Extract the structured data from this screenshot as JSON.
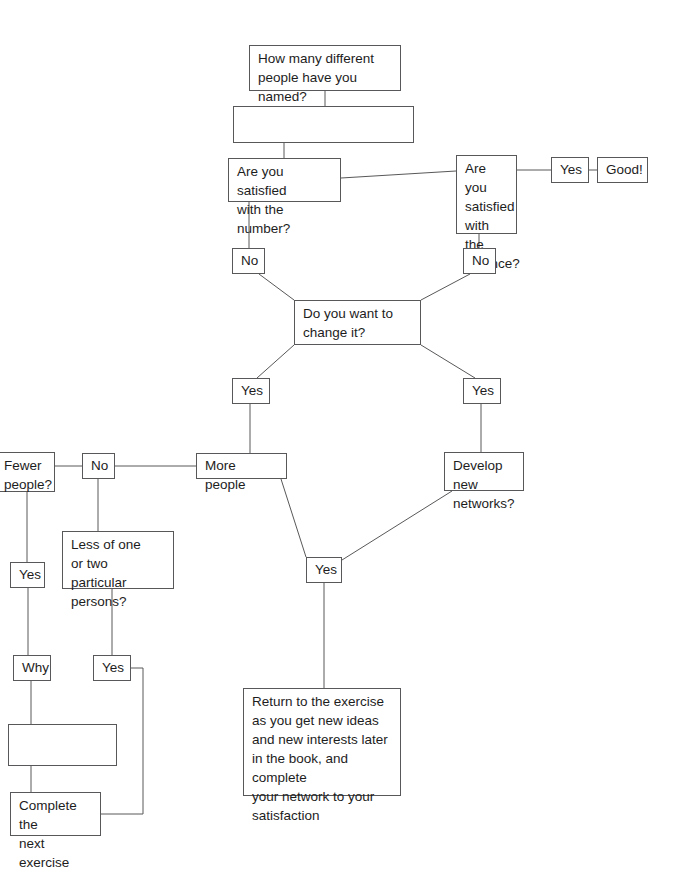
{
  "diagram": {
    "stroke_color": "#58585a",
    "text_color": "#1d1d1d",
    "background": "#ffffff",
    "nodes": [
      {
        "id": "how-many",
        "label": "How many different\npeople have you named?",
        "x": 249,
        "y": 45,
        "w": 152,
        "h": 46
      },
      {
        "id": "answer-blank-1",
        "label": "",
        "x": 233,
        "y": 106,
        "w": 181,
        "h": 37
      },
      {
        "id": "satisfied-number",
        "label": "Are you satisfied\nwith the number?",
        "x": 228,
        "y": 158,
        "w": 113,
        "h": 44
      },
      {
        "id": "satisfied-balance",
        "label": "Are you\nsatisfied\nwith the\nbalance?",
        "x": 456,
        "y": 155,
        "w": 61,
        "h": 79
      },
      {
        "id": "yes-balance",
        "label": "Yes",
        "x": 551,
        "y": 157,
        "w": 38,
        "h": 26
      },
      {
        "id": "good",
        "label": "Good!",
        "x": 597,
        "y": 157,
        "w": 51,
        "h": 26
      },
      {
        "id": "no-number",
        "label": "No",
        "x": 232,
        "y": 248,
        "w": 33,
        "h": 26
      },
      {
        "id": "no-balance",
        "label": "No",
        "x": 463,
        "y": 248,
        "w": 33,
        "h": 26
      },
      {
        "id": "change-it",
        "label": "Do you want to\nchange it?",
        "x": 294,
        "y": 300,
        "w": 127,
        "h": 45
      },
      {
        "id": "yes-left",
        "label": "Yes",
        "x": 232,
        "y": 378,
        "w": 38,
        "h": 26
      },
      {
        "id": "yes-right",
        "label": "Yes",
        "x": 463,
        "y": 378,
        "w": 38,
        "h": 26
      },
      {
        "id": "more-people",
        "label": "More people",
        "x": 196,
        "y": 453,
        "w": 91,
        "h": 26
      },
      {
        "id": "develop-networks",
        "label": "Develop new\nnetworks?",
        "x": 444,
        "y": 452,
        "w": 80,
        "h": 39
      },
      {
        "id": "no-fewer",
        "label": "No",
        "x": 82,
        "y": 453,
        "w": 33,
        "h": 26
      },
      {
        "id": "fewer-people",
        "label": "Fewer\npeople?",
        "x": -5,
        "y": 452,
        "w": 60,
        "h": 40
      },
      {
        "id": "less-of-one",
        "label": "Less of one\nor two particular\npersons?",
        "x": 62,
        "y": 531,
        "w": 112,
        "h": 58
      },
      {
        "id": "yes-fewer",
        "label": "Yes",
        "x": 10,
        "y": 562,
        "w": 35,
        "h": 26
      },
      {
        "id": "yes-less",
        "label": "Yes",
        "x": 93,
        "y": 655,
        "w": 38,
        "h": 26
      },
      {
        "id": "why",
        "label": "Why",
        "x": 13,
        "y": 655,
        "w": 38,
        "h": 26
      },
      {
        "id": "answer-blank-2",
        "label": "",
        "x": 8,
        "y": 724,
        "w": 109,
        "h": 42
      },
      {
        "id": "complete-next",
        "label": "Complete the\nnext exercise",
        "x": 10,
        "y": 792,
        "w": 91,
        "h": 44
      },
      {
        "id": "yes-center",
        "label": "Yes",
        "x": 306,
        "y": 557,
        "w": 36,
        "h": 26
      },
      {
        "id": "return-exercise",
        "label": "Return to the exercise\nas you get new ideas\nand new interests later\nin the book, and complete\nyour network to your\nsatisfaction",
        "x": 243,
        "y": 688,
        "w": 158,
        "h": 108
      }
    ],
    "edges": [
      {
        "id": "how-many-to-blank1",
        "points": "325,91 325,106"
      },
      {
        "id": "blank1-to-satisfied-number",
        "points": "284,143 284,158"
      },
      {
        "id": "satisfied-number-to-balance",
        "points": "341,178 456,171"
      },
      {
        "id": "balance-to-yes",
        "points": "517,170 551,170"
      },
      {
        "id": "yes-to-good",
        "points": "589,170 597,170"
      },
      {
        "id": "satisfied-number-to-no",
        "points": "249,202 249,248"
      },
      {
        "id": "balance-to-no",
        "points": "479,234 479,248"
      },
      {
        "id": "no-number-to-change",
        "points": "259,274 294,300"
      },
      {
        "id": "no-balance-to-change",
        "points": "470,274 421,300"
      },
      {
        "id": "change-to-yes-left",
        "points": "294,345 257,378"
      },
      {
        "id": "change-to-yes-right",
        "points": "421,345 475,378"
      },
      {
        "id": "yes-left-to-more-people",
        "points": "250,404 250,453"
      },
      {
        "id": "yes-right-to-develop",
        "points": "481,404 481,452"
      },
      {
        "id": "more-people-to-no-fewer",
        "points": "196,466 115,466"
      },
      {
        "id": "no-fewer-to-fewer-people",
        "points": "82,466 55,466"
      },
      {
        "id": "fewer-people-to-yes",
        "points": "27,492 27,562"
      },
      {
        "id": "no-fewer-to-less-of-one",
        "points": "98,479 98,531"
      },
      {
        "id": "less-of-one-to-yes",
        "points": "112,589 112,655"
      },
      {
        "id": "yes-fewer-to-why",
        "points": "28,588 28,655"
      },
      {
        "id": "why-to-blank2",
        "points": "31,681 31,724"
      },
      {
        "id": "blank2-to-complete",
        "points": "31,766 31,792"
      },
      {
        "id": "yes-less-to-complete",
        "points": "131,668 143,668 143,814 101,814"
      },
      {
        "id": "more-people-to-yes-center",
        "points": "281,479 306,557"
      },
      {
        "id": "develop-to-yes-center",
        "points": "452,491 342,560"
      },
      {
        "id": "yes-center-to-return",
        "points": "324,583 324,688"
      }
    ]
  }
}
